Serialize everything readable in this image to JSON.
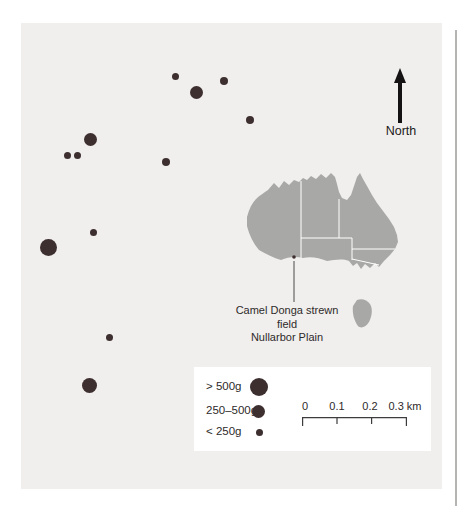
{
  "colors": {
    "panel_bg": "#f0efed",
    "dot": "#3d2f2f",
    "australia": "#a8a8a6",
    "ink": "#262222"
  },
  "north": {
    "label": "North"
  },
  "inset": {
    "label_line1": "Camel Donga strewn field",
    "label_line2": "Nullarbor Plain"
  },
  "legend": {
    "items": [
      {
        "label": "> 500g",
        "size": "large"
      },
      {
        "label": "250–500g",
        "size": "medium"
      },
      {
        "label": "< 250g",
        "size": "small"
      }
    ]
  },
  "scale_bar": {
    "labels": [
      "0",
      "0.1",
      "0.2",
      "0.3 km"
    ]
  },
  "map_points": [
    {
      "x": 175,
      "y": 76,
      "d": 7,
      "mass": "< 250g"
    },
    {
      "x": 196,
      "y": 92,
      "d": 13,
      "mass": "250–500g"
    },
    {
      "x": 224,
      "y": 81,
      "d": 8,
      "mass": "< 250g"
    },
    {
      "x": 250,
      "y": 120,
      "d": 8,
      "mass": "< 250g"
    },
    {
      "x": 90,
      "y": 139,
      "d": 13,
      "mass": "250–500g"
    },
    {
      "x": 67,
      "y": 155,
      "d": 7,
      "mass": "< 250g"
    },
    {
      "x": 77,
      "y": 155,
      "d": 7,
      "mass": "< 250g"
    },
    {
      "x": 166,
      "y": 162,
      "d": 8,
      "mass": "< 250g"
    },
    {
      "x": 93,
      "y": 232,
      "d": 7,
      "mass": "< 250g"
    },
    {
      "x": 48,
      "y": 247,
      "d": 17,
      "mass": "> 500g"
    },
    {
      "x": 109,
      "y": 337,
      "d": 7,
      "mass": "< 250g"
    },
    {
      "x": 89,
      "y": 385,
      "d": 15,
      "mass": "> 500g"
    }
  ]
}
